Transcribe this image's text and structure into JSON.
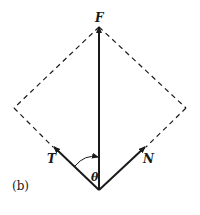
{
  "figure": {
    "panel_label": "(b)",
    "vectors": {
      "F": {
        "label": "F",
        "description": "resultant force, vertical"
      },
      "T": {
        "label": "T",
        "description": "component up-left"
      },
      "N": {
        "label": "N",
        "description": "component up-right"
      }
    },
    "angle_label": "θ",
    "construction": "dashed parallelogram (rhombus) completing T and N to F",
    "colors": {
      "ink": "#1a1a1a",
      "background": "#ffffff"
    }
  }
}
